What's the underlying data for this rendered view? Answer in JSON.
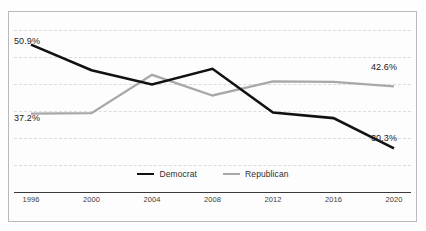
{
  "title_remnant": "",
  "colors": {
    "democrat": "#111111",
    "republican": "#a8a8a8",
    "gridline": "#dcdcdc",
    "axis": "#3a3a3a",
    "frame": "#b9b9bd",
    "background": "#fdfdfd",
    "text": "#222222"
  },
  "legend": {
    "position": "bottom-center",
    "items": [
      {
        "label": "Democrat",
        "color": "#111111",
        "name": "legend-democrat"
      },
      {
        "label": "Republican",
        "color": "#a8a8a8",
        "name": "legend-republican"
      }
    ]
  },
  "axis": {
    "x_ticks": [
      "1996",
      "2000",
      "2004",
      "2008",
      "2012",
      "2016",
      "2020"
    ],
    "y_visible": false,
    "grid": true,
    "gridline_count": 6
  },
  "annotations": [
    {
      "text": "50.9%",
      "series": "Democrat",
      "x": "1996",
      "anchor": "above-left",
      "name": "label-democrat-1996"
    },
    {
      "text": "37.2%",
      "series": "Republican",
      "x": "1996",
      "anchor": "below-left",
      "name": "label-republican-1996"
    },
    {
      "text": "42.6%",
      "series": "Republican",
      "x": "2020",
      "anchor": "above-right",
      "name": "label-republican-2020"
    },
    {
      "text": "30.3%",
      "series": "Democrat",
      "x": "2020",
      "anchor": "below-right",
      "name": "label-democrat-2020"
    }
  ],
  "chart_data": {
    "type": "line",
    "title": "",
    "subtitle": "",
    "xlabel": "",
    "ylabel": "",
    "categories": [
      "1996",
      "2000",
      "2004",
      "2008",
      "2012",
      "2016",
      "2020"
    ],
    "ylim": [
      26,
      55
    ],
    "grid": true,
    "legend_position": "bottom-center",
    "series": [
      {
        "name": "Democrat",
        "color": "#111111",
        "values": [
          50.9,
          45.8,
          43.0,
          46.1,
          37.4,
          36.3,
          30.3
        ],
        "endpoint_labels": {
          "1996": "50.9%",
          "2020": "30.3%"
        }
      },
      {
        "name": "Republican",
        "color": "#a8a8a8",
        "values": [
          37.2,
          37.3,
          44.9,
          40.8,
          43.6,
          43.5,
          42.6
        ],
        "endpoint_labels": {
          "1996": "37.2%",
          "2020": "42.6%"
        }
      }
    ]
  }
}
